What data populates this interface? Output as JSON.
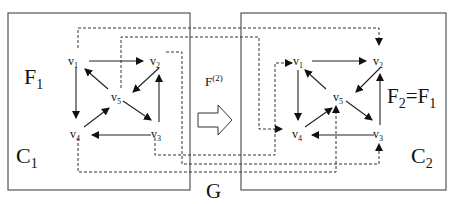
{
  "labels": {
    "left_functor": {
      "main": "F",
      "sub": "1"
    },
    "left_category": {
      "main": "C",
      "sub": "1"
    },
    "right_functor": {
      "main": "F",
      "sub": "2",
      "eq": "=F",
      "eq_sub": "1"
    },
    "right_category": {
      "main": "C",
      "sub": "2"
    },
    "map": {
      "main": "F",
      "sup": "(2)"
    },
    "graph": "G"
  },
  "vertices": {
    "v1": {
      "main": "v",
      "sub": "1"
    },
    "v2": {
      "main": "v",
      "sub": "2"
    },
    "v3": {
      "main": "v",
      "sub": "3"
    },
    "v4": {
      "main": "v",
      "sub": "4"
    },
    "v5": {
      "main": "v",
      "sub": "5"
    }
  },
  "edges_within_each_graph": [
    [
      "v1",
      "v2"
    ],
    [
      "v1",
      "v4"
    ],
    [
      "v2",
      "v5"
    ],
    [
      "v5",
      "v1"
    ],
    [
      "v5",
      "v3"
    ],
    [
      "v3",
      "v2"
    ],
    [
      "v3",
      "v4"
    ],
    [
      "v4",
      "v5"
    ]
  ],
  "dashed_mappings": [
    [
      "v1",
      "v2'"
    ],
    [
      "v5",
      "v4'"
    ],
    [
      "v2",
      "v3'"
    ],
    [
      "v3",
      "v1'"
    ],
    [
      "v4",
      "v5'"
    ]
  ],
  "colors": {
    "line": "#222222",
    "box": "#555555",
    "background": "#ffffff"
  }
}
